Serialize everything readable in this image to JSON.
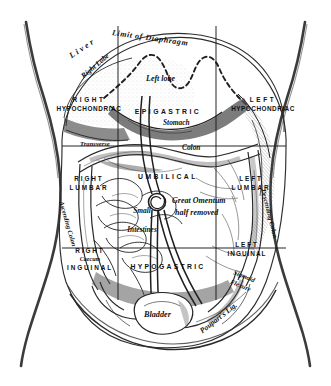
{
  "figure": {
    "type": "anatomical-illustration",
    "style": "engraving",
    "colors": {
      "ink": "#1b1b1b",
      "paper": "#ffffff",
      "shading": "#6f6f6f"
    }
  },
  "grid": {
    "description": "nine abdominal regions delimited by two vertical midclavicular lines and two horizontal transpyloric/transtubercular planes",
    "vertical_lines": 2,
    "horizontal_lines": 2
  },
  "regions": {
    "upper": [
      {
        "key": "right-hypochondriac",
        "line1": "RIGHT",
        "line2": "HYPOCHONDRIAC"
      },
      {
        "key": "epigastric",
        "line1": "EPIGASTRIC",
        "line2": ""
      },
      {
        "key": "left-hypochondriac",
        "line1": "LEFT",
        "line2": "HYPOCHONDRIAC"
      }
    ],
    "middle": [
      {
        "key": "right-lumbar",
        "line1": "RIGHT",
        "line2": "LUMBAR"
      },
      {
        "key": "umbilical",
        "line1": "UMBILICAL",
        "line2": ""
      },
      {
        "key": "left-lumbar",
        "line1": "LEFT",
        "line2": "LUMBAR"
      }
    ],
    "lower": [
      {
        "key": "right-inguinal",
        "line1": "RIGHT",
        "line2": "INGUINAL"
      },
      {
        "key": "hypogastric",
        "line1": "HYPOGASTRIC",
        "line2": ""
      },
      {
        "key": "left-inguinal",
        "line1": "LEFT",
        "line2": "INGUINAL"
      }
    ]
  },
  "organ_labels": {
    "limit_of_diaphragm": "Limit of Diaphragm",
    "liver": "Liver",
    "right_lobe": "Right Lobe",
    "left_lobe": "Left lobe",
    "stomach": "Stomach",
    "colon": "Colon",
    "transverse": "Transverse",
    "ascending_colon": "Ascending Colon",
    "descending_colon": "Descending Colon",
    "great_omentum_line1": "Great Omentum",
    "great_omentum_line2": "half removed",
    "small": "Small",
    "intestines": "Intestines",
    "caecum": "Caecum",
    "sigmoid_line1": "Sigmoid",
    "sigmoid_line2": "Flexure",
    "bladder": "Bladder",
    "pouparts_ligament": "Poupart's Lig."
  }
}
